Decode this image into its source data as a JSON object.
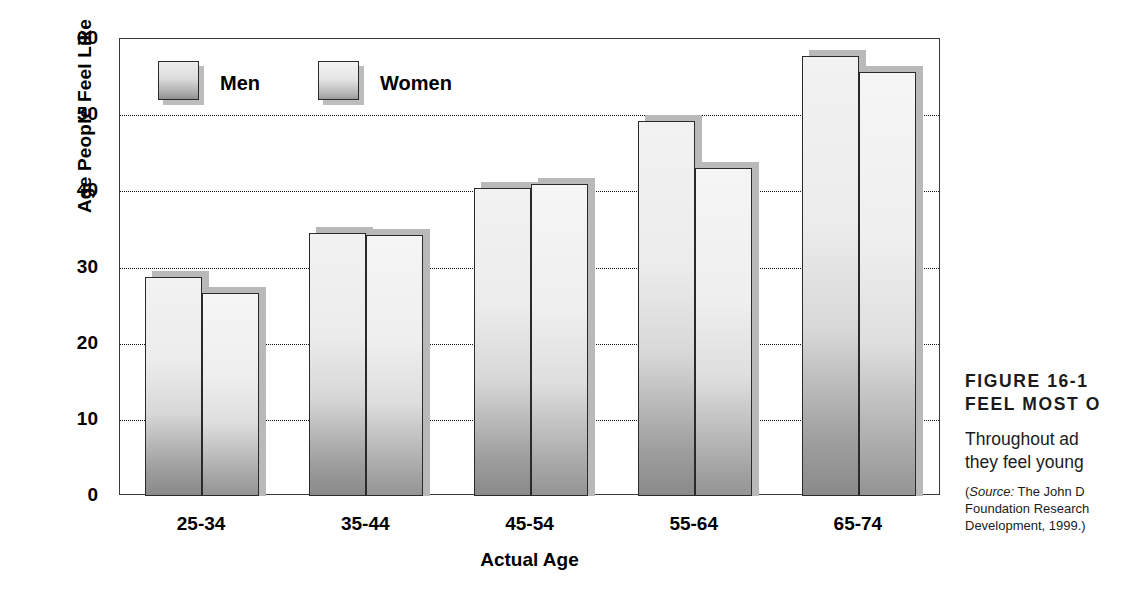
{
  "figure": {
    "caption_number": "FIGURE 16-1",
    "caption_title_line2": "FEEL MOST O",
    "body_line1": "Throughout  ad",
    "body_line2": "they feel young",
    "source_line1_prefix": "(",
    "source_label": "Source:",
    "source_line1_rest": " The John D",
    "source_line2": "Foundation Research",
    "source_line3": "Development, 1999.)"
  },
  "legend": {
    "items": [
      {
        "label": "Men",
        "key": "men"
      },
      {
        "label": "Women",
        "key": "women"
      }
    ]
  },
  "chart_data": {
    "type": "bar",
    "title": "",
    "xlabel": "Actual Age",
    "ylabel": "Age People Feel Like",
    "categories": [
      "25-34",
      "35-44",
      "45-54",
      "55-64",
      "65-74"
    ],
    "series": [
      {
        "name": "Men",
        "values": [
          28.7,
          34.5,
          40.5,
          49.2,
          57.8
        ]
      },
      {
        "name": "Women",
        "values": [
          26.7,
          34.3,
          41.0,
          43.0,
          55.7
        ]
      }
    ],
    "ylim": [
      0,
      60
    ],
    "yticks": [
      0,
      10,
      20,
      30,
      40,
      50,
      60
    ],
    "ytick_labels": [
      "0",
      "10",
      "20",
      "30",
      "40",
      "50",
      "60"
    ],
    "gridlines": [
      10,
      20,
      30,
      40,
      50
    ],
    "grid": true,
    "grid_style": "dotted",
    "legend_position": "inside-top-left",
    "bar_style": {
      "fill": "gradient-gray",
      "edge_color": "#2a2a2a",
      "shadow_color": "#b9b9b9"
    }
  }
}
